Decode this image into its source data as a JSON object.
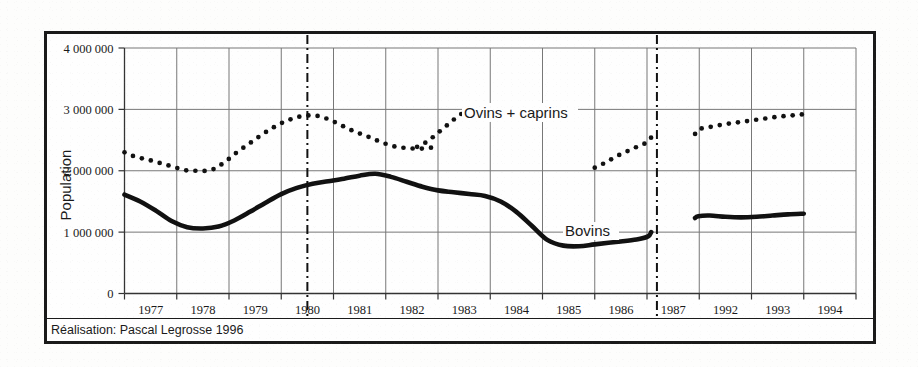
{
  "figure": {
    "axis_label_y": "Population",
    "attribution": "Réalisation: Pascal Legrosse 1996",
    "series_label_ovins": "Ovins + caprins",
    "series_label_bovins": "Bovins"
  },
  "axes": {
    "y_ticks": [
      "0",
      "1 000 000",
      "2 000 000",
      "3 000 000",
      "4 000 000"
    ],
    "x_ticks": [
      "1977",
      "1978",
      "1979",
      "1980",
      "1981",
      "1982",
      "1983",
      "1984",
      "1985",
      "1986",
      "1987",
      "1992",
      "1993",
      "1994"
    ]
  },
  "colors": {
    "frame": "#1a1a1a",
    "grid": "#777777",
    "axis": "#333333",
    "bovins": "#111111",
    "ovins": "#111111",
    "text": "#1a1a1a"
  },
  "chart_data": {
    "type": "line",
    "title": "",
    "subtitle": "",
    "xlabel": "",
    "ylabel": "Population",
    "ylim": [
      0,
      4000000
    ],
    "y_ticks": [
      0,
      1000000,
      2000000,
      3000000,
      4000000
    ],
    "x_categories": [
      "1977",
      "1978",
      "1979",
      "1980",
      "1981",
      "1982",
      "1983",
      "1984",
      "1985",
      "1986",
      "1987",
      "1992",
      "1993",
      "1994"
    ],
    "grid": true,
    "legend_position": "inline-annotation",
    "annotations": [
      {
        "text": "Ovins + caprins",
        "x": 1983.3,
        "y": 3000000
      },
      {
        "text": "Bovins",
        "x": 1984.6,
        "y": 1000000
      },
      {
        "text": "Réalisation: Pascal Legrosse 1996",
        "x": 1977.0,
        "y": -450000
      }
    ],
    "axis_breaks": [
      {
        "label": "break-1",
        "x": 1980.5
      },
      {
        "label": "break-2",
        "x": 1987.95
      }
    ],
    "series": [
      {
        "name": "Ovins + caprins",
        "style": "dotted",
        "segments": [
          {
            "name": "1977-1983",
            "x": [
              1977.0,
              1977.2,
              1977.45,
              1977.7,
              1977.95,
              1978.15,
              1978.4,
              1978.65,
              1978.9,
              1979.15,
              1979.4,
              1979.65,
              1979.9,
              1980.15,
              1980.4,
              1980.65,
              1980.9,
              1981.15,
              1981.4,
              1981.65,
              1981.9,
              1982.15,
              1982.4,
              1982.65,
              1982.9
            ],
            "y": [
              2300000,
              2230000,
              2180000,
              2120000,
              2060000,
              2010000,
              2000000,
              2010000,
              2130000,
              2300000,
              2450000,
              2600000,
              2730000,
              2830000,
              2890000,
              2900000,
              2840000,
              2740000,
              2640000,
              2560000,
              2470000,
              2400000,
              2370000,
              2360000,
              2380000
            ]
          },
          {
            "name": "1983-continued",
            "x": [
              1982.6,
              1982.8,
              1983.0,
              1983.2,
              1983.4,
              1983.6
            ],
            "y": [
              2390000,
              2480000,
              2620000,
              2760000,
              2900000,
              3000000
            ]
          },
          {
            "name": "1986-1987",
            "x": [
              1986.0,
              1986.15,
              1986.3,
              1986.45,
              1986.6,
              1986.75,
              1986.9,
              1987.05,
              1987.2,
              1987.4,
              1987.6
            ],
            "y": [
              2050000,
              2110000,
              2180000,
              2250000,
              2310000,
              2370000,
              2420000,
              2470000,
              2510000,
              2540000,
              2550000
            ]
          },
          {
            "name": "1992-1994",
            "x": [
              1991.6,
              1991.8,
              1992.0,
              1992.25,
              1992.5,
              1992.75,
              1993.0,
              1993.25,
              1993.5,
              1993.75,
              1994.0
            ],
            "y": [
              2600000,
              2640000,
              2680000,
              2720000,
              2760000,
              2790000,
              2820000,
              2850000,
              2880000,
              2900000,
              2920000
            ]
          }
        ]
      },
      {
        "name": "Bovins",
        "style": "solid",
        "segments": [
          {
            "name": "1977-1987",
            "x": [
              1977.0,
              1977.3,
              1977.6,
              1977.9,
              1978.2,
              1978.5,
              1978.8,
              1979.1,
              1979.4,
              1979.7,
              1980.0,
              1980.3,
              1980.6,
              1980.9,
              1981.2,
              1981.5,
              1981.8,
              1982.1,
              1982.4,
              1982.7,
              1983.0,
              1983.3,
              1983.6,
              1983.9,
              1984.2,
              1984.5,
              1984.8,
              1985.1,
              1985.4,
              1985.7,
              1986.0,
              1986.4,
              1986.8,
              1987.1,
              1987.4
            ],
            "y": [
              1610000,
              1500000,
              1350000,
              1180000,
              1080000,
              1060000,
              1090000,
              1190000,
              1330000,
              1480000,
              1620000,
              1720000,
              1790000,
              1830000,
              1870000,
              1920000,
              1950000,
              1900000,
              1820000,
              1740000,
              1680000,
              1650000,
              1620000,
              1590000,
              1500000,
              1330000,
              1100000,
              870000,
              780000,
              770000,
              800000,
              840000,
              880000,
              930000,
              1000000
            ]
          },
          {
            "name": "1992-1994",
            "x": [
              1991.6,
              1991.9,
              1992.2,
              1992.5,
              1992.8,
              1993.1,
              1993.4,
              1993.7,
              1994.0
            ],
            "y": [
              1230000,
              1260000,
              1270000,
              1250000,
              1240000,
              1250000,
              1270000,
              1290000,
              1300000
            ]
          }
        ]
      }
    ]
  }
}
